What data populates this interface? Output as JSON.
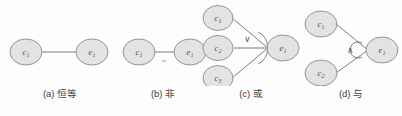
{
  "figure": {
    "background_color": "#fdfdfd",
    "node_fill_color": "#e3e3e3",
    "node_stroke_color": "#8a8a8a",
    "edge_color": "#6e6e6e"
  },
  "panels": [
    {
      "id": "a",
      "caption": "(a) 恒等",
      "operator_symbol": "",
      "nodes": [
        {
          "label_base": "c",
          "label_sub": "1"
        },
        {
          "label_base": "e",
          "label_sub": "1"
        }
      ]
    },
    {
      "id": "b",
      "caption": "(b) 非",
      "operator_symbol": "~",
      "nodes": [
        {
          "label_base": "c",
          "label_sub": "1"
        },
        {
          "label_base": "e",
          "label_sub": "1"
        }
      ]
    },
    {
      "id": "c",
      "caption": "(c) 或",
      "operator_symbol": "∨",
      "nodes": [
        {
          "label_base": "c",
          "label_sub": "1"
        },
        {
          "label_base": "c",
          "label_sub": "2"
        },
        {
          "label_base": "c",
          "label_sub": "3"
        },
        {
          "label_base": "e",
          "label_sub": "1"
        }
      ]
    },
    {
      "id": "d",
      "caption": "(d) 与",
      "operator_symbol": "∧",
      "nodes": [
        {
          "label_base": "c",
          "label_sub": "1"
        },
        {
          "label_base": "c",
          "label_sub": "2"
        },
        {
          "label_base": "e",
          "label_sub": "1"
        }
      ]
    }
  ]
}
